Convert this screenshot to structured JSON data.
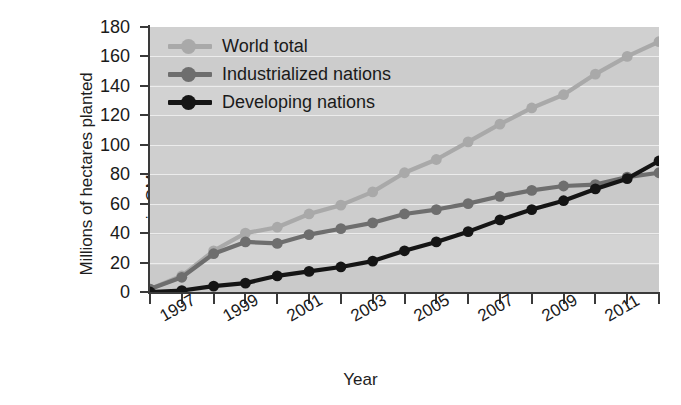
{
  "chart_data": {
    "type": "line",
    "title": "",
    "xlabel": "Year",
    "ylabel": "Millions of hectares planted in GM crops",
    "ylabel_line1": "Millions of hectares planted",
    "ylabel_line2": "in GM crops",
    "ylim": [
      0,
      180
    ],
    "ytick_step": 20,
    "yticks": [
      180,
      160,
      140,
      120,
      100,
      80,
      60,
      40,
      20,
      0
    ],
    "xlim": [
      1996,
      2012
    ],
    "x": [
      1996,
      1997,
      1998,
      1999,
      2000,
      2001,
      2002,
      2003,
      2004,
      2005,
      2006,
      2007,
      2008,
      2009,
      2010,
      2011,
      2012
    ],
    "xticks": [
      1996,
      1997,
      1998,
      1999,
      2000,
      2001,
      2002,
      2003,
      2004,
      2005,
      2006,
      2007,
      2008,
      2009,
      2010,
      2011,
      2012
    ],
    "xtick_labels": [
      "1997",
      "1999",
      "2001",
      "2003",
      "2005",
      "2007",
      "2009",
      "2011"
    ],
    "xtick_labels_values": [
      1997,
      1999,
      2001,
      2003,
      2005,
      2007,
      2009,
      2011
    ],
    "grid": true,
    "grid_axis": "y",
    "legend_position": "top-left inside plot",
    "series": [
      {
        "name": "World total",
        "color": "#a9a9a9",
        "marker": "circle",
        "values": [
          2,
          11,
          28,
          40,
          44,
          53,
          59,
          68,
          81,
          90,
          102,
          114,
          125,
          134,
          148,
          160,
          170
        ]
      },
      {
        "name": "Industrialized nations",
        "color": "#6e6e6e",
        "marker": "circle",
        "values": [
          2,
          10,
          26,
          34,
          33,
          39,
          43,
          47,
          53,
          56,
          60,
          65,
          69,
          72,
          73,
          78,
          81
        ]
      },
      {
        "name": "Developing nations",
        "color": "#151515",
        "marker": "circle",
        "values": [
          0,
          1,
          4,
          6,
          11,
          14,
          17,
          21,
          28,
          34,
          41,
          49,
          56,
          62,
          70,
          77,
          89
        ]
      }
    ]
  },
  "legend": {
    "items": [
      {
        "label": "World total",
        "color": "#a9a9a9"
      },
      {
        "label": "Industrialized nations",
        "color": "#6e6e6e"
      },
      {
        "label": "Developing nations",
        "color": "#151515"
      }
    ]
  },
  "axes": {
    "x_title": "Year",
    "y_title_line1": "Millions of hectares planted",
    "y_title_line2": "in GM crops"
  },
  "colors": {
    "plot_background": "#cfcfcf",
    "gridline": "#ececec",
    "axis": "#3a3a3a",
    "text": "#1a1a1a",
    "world_total": "#a9a9a9",
    "industrialized": "#6e6e6e",
    "developing": "#151515"
  }
}
